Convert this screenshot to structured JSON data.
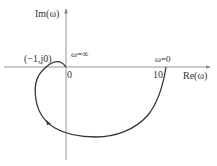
{
  "diagram": {
    "type": "nyquist-plot",
    "axes": {
      "x_label": "Re(ω)",
      "y_label": "Im(ω)"
    },
    "tick_labels": {
      "origin": "0",
      "ten": "10"
    },
    "annotations": {
      "critical_point": "(−1,j0)",
      "omega_infinity": "ω=∞",
      "omega_zero": "ω=0"
    },
    "curve": {
      "start": {
        "re": 10,
        "im": 0,
        "label": "ω=0"
      },
      "end": {
        "re": 0,
        "im": 0,
        "label": "ω=∞"
      },
      "direction_arrow": true
    },
    "colors": {
      "axis": "#8a8a8a",
      "curve": "#333333",
      "text": "#333333"
    }
  }
}
